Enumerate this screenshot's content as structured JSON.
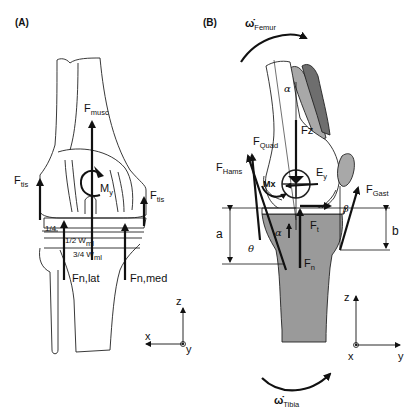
{
  "panels": {
    "a": {
      "label": "(A)",
      "forces": {
        "f_musc": {
          "base": "F",
          "sub": "musc"
        },
        "f_tis_left": {
          "base": "F",
          "sub": "tis"
        },
        "f_tis_right": {
          "base": "F",
          "sub": "tis"
        },
        "m_y": {
          "base": "M",
          "sub": "y"
        },
        "fn_lat": "Fn,lat",
        "fn_med": "Fn,med"
      },
      "dimensions": {
        "quarter": "1/4",
        "half": {
          "base": "1/2 W",
          "sub": "ml"
        },
        "three_quarter": {
          "base": "3/4 W",
          "sub": "ml"
        }
      },
      "axes": {
        "z": "z",
        "x": "x",
        "y": "y"
      }
    },
    "b": {
      "label": "(B)",
      "rotations": {
        "femur": {
          "base": "ω̇",
          "sub": "Femur"
        },
        "tibia": {
          "base": "ω̇",
          "sub": "Tibia"
        }
      },
      "forces": {
        "f_quad": {
          "base": "F",
          "sub": "Quad"
        },
        "f_hams": {
          "base": "F",
          "sub": "Hams"
        },
        "f_gast": {
          "base": "F",
          "sub": "Gast"
        },
        "f_z": "Fz",
        "e_y": {
          "base": "E",
          "sub": "y"
        },
        "m_x": "Mx",
        "f_t": {
          "base": "F",
          "sub": "t"
        },
        "f_n": {
          "base": "F",
          "sub": "n"
        }
      },
      "angles": {
        "alpha_top": "α",
        "alpha_tibia": "α",
        "beta": "β",
        "theta": "θ"
      },
      "dimensions": {
        "a": "a",
        "b": "b"
      },
      "axes": {
        "z": "z",
        "x": "x",
        "y": "y"
      }
    }
  },
  "colors": {
    "ink": "#111111",
    "bone_fill": "#ffffff",
    "tibia_fill": "#9a9a9a",
    "muscle_light": "#a8a8a8",
    "muscle_dark": "#6e6e6e"
  }
}
